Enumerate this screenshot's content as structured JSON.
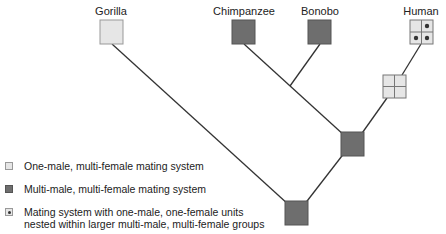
{
  "taxa": [
    {
      "name": "Gorilla",
      "state": "one-male-multi-female"
    },
    {
      "name": "Chimpanzee",
      "state": "multi-male-multi-female"
    },
    {
      "name": "Bonobo",
      "state": "multi-male-multi-female"
    },
    {
      "name": "Human",
      "state": "nested-pair-bond"
    }
  ],
  "legend": [
    {
      "type": "one-male-multi-female",
      "text": "One-male, multi-female mating system"
    },
    {
      "type": "multi-male-multi-female",
      "text": "Multi-male, multi-female mating system"
    },
    {
      "type": "nested-pair-bond",
      "line1": "Mating system with one-male, one-female units",
      "line2": "nested within larger multi-male, multi-female groups"
    }
  ],
  "colors": {
    "light": "#e6e6e6",
    "dark": "#6e6e6e",
    "line": "#333333",
    "border": "#999999"
  }
}
